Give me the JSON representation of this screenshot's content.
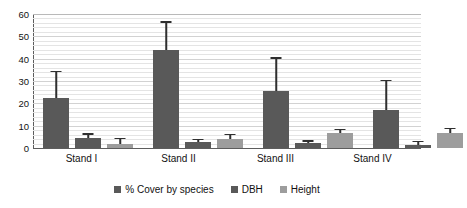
{
  "chart_data": {
    "type": "bar",
    "title": "",
    "xlabel": "",
    "ylabel": "",
    "ylim": [
      0,
      60
    ],
    "ytick_labels": [
      "60",
      "50",
      "40",
      "30",
      "20",
      "10",
      "0"
    ],
    "ytick_values": [
      60,
      50,
      40,
      30,
      20,
      10,
      0
    ],
    "ytick_step": 10,
    "minor_gridline_step": 2,
    "grid": true,
    "legend_position": "bottom",
    "error_bars": "upper-only",
    "categories": [
      "Stand I",
      "Stand II",
      "Stand III",
      "Stand IV"
    ],
    "series": [
      {
        "name": "% Cover by species",
        "color": "#595959",
        "values": [
          22.5,
          44.0,
          25.5,
          17.0
        ],
        "error_upper": [
          11.5,
          12.0,
          14.5,
          13.0
        ],
        "error_top_values": [
          34.0,
          56.0,
          40.0,
          30.0
        ]
      },
      {
        "name": "DBH",
        "color": "#595959",
        "values": [
          4.5,
          2.8,
          2.2,
          1.5
        ],
        "error_upper": [
          1.5,
          0.7,
          0.6,
          1.0
        ],
        "error_top_values": [
          6.0,
          3.5,
          2.8,
          2.5
        ]
      },
      {
        "name": "Height",
        "color": "#9d9d9d",
        "values": [
          1.8,
          4.0,
          6.5,
          6.5
        ],
        "error_upper": [
          2.2,
          1.8,
          1.5,
          1.8
        ],
        "error_top_values": [
          4.0,
          5.8,
          8.0,
          8.3
        ]
      }
    ]
  }
}
